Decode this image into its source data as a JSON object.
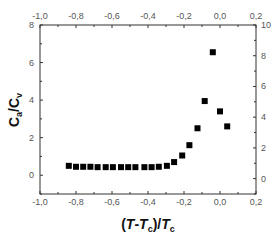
{
  "chart_data": {
    "type": "scatter",
    "title": "",
    "xlabel": "(T-Tc)/Tc",
    "xlabel_parts": {
      "open": "(",
      "T1": "T",
      "dash": "-",
      "T2": "T",
      "sub1": "c",
      "close_slash": ")/",
      "T3": "T",
      "sub2": "c"
    },
    "ylabel": "Ca/Cv",
    "ylabel_parts": {
      "C1": "C",
      "sub1": "a",
      "slash": "/",
      "C2": "C",
      "sub2": "v"
    },
    "xlim": [
      -1.0,
      0.2
    ],
    "ylim_left": [
      -1,
      8
    ],
    "ylim_right": [
      -1,
      10
    ],
    "x_ticks": [
      "-1,0",
      "-0,8",
      "-0,6",
      "-0,4",
      "-0,2",
      "0,0",
      "0,2"
    ],
    "x_tick_values": [
      -1.0,
      -0.8,
      -0.6,
      -0.4,
      -0.2,
      0.0,
      0.2
    ],
    "top_x_ticks": [
      "-1,0",
      "-0,8",
      "-0,6",
      "-0,4",
      "-0,2",
      "0,0",
      "0,2"
    ],
    "y_left_ticks": [
      "0",
      "2",
      "4",
      "6",
      "8"
    ],
    "y_left_tick_values": [
      0,
      2,
      4,
      6,
      8
    ],
    "y_right_ticks": [
      "0",
      "2",
      "4",
      "6",
      "8",
      "10"
    ],
    "y_right_tick_values": [
      0,
      2,
      4,
      6,
      8,
      10
    ],
    "grid": false,
    "legend": null,
    "marker": "square",
    "series": [
      {
        "name": "Ca/Cv",
        "x": [
          -0.84,
          -0.8,
          -0.76,
          -0.72,
          -0.68,
          -0.635,
          -0.595,
          -0.55,
          -0.51,
          -0.47,
          -0.42,
          -0.38,
          -0.34,
          -0.295,
          -0.255,
          -0.21,
          -0.17,
          -0.125,
          -0.085,
          -0.04,
          0.0,
          0.04
        ],
        "y": [
          0.5,
          0.45,
          0.45,
          0.45,
          0.43,
          0.43,
          0.43,
          0.43,
          0.43,
          0.43,
          0.43,
          0.43,
          0.45,
          0.5,
          0.7,
          1.05,
          1.6,
          2.5,
          3.95,
          6.55,
          3.4,
          2.6
        ]
      }
    ]
  }
}
